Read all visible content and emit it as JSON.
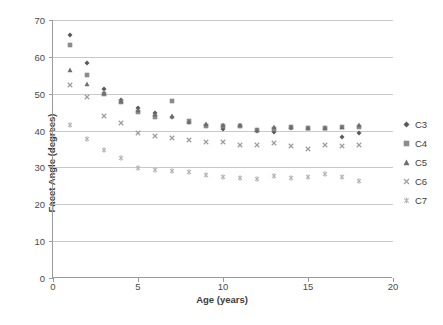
{
  "chart_data": {
    "type": "scatter",
    "title": "",
    "xlabel": "Age (years)",
    "ylabel": "Facet Angle (degrees)",
    "xlim": [
      0,
      20
    ],
    "ylim": [
      0,
      70
    ],
    "xticks": [
      0,
      5,
      10,
      15,
      20
    ],
    "yticks": [
      0,
      10,
      20,
      30,
      40,
      50,
      60,
      70
    ],
    "grid": "horizontal",
    "legend_position": "right",
    "x": [
      1,
      2,
      3,
      4,
      5,
      6,
      7,
      8,
      9,
      10,
      11,
      12,
      13,
      14,
      15,
      16,
      17,
      18
    ],
    "series": [
      {
        "name": "C3",
        "marker": "diamond",
        "color": "#595959",
        "values": [
          66.0,
          58.4,
          51.4,
          48.4,
          46.0,
          44.7,
          43.6,
          42.4,
          41.6,
          40.4,
          41.2,
          40.0,
          39.7,
          40.8,
          40.6,
          40.6,
          38.3,
          39.4
        ]
      },
      {
        "name": "C4",
        "marker": "square",
        "color": "#8c8c8c",
        "values": [
          63.2,
          55.2,
          49.8,
          47.7,
          45.0,
          43.8,
          47.9,
          42.5,
          41.2,
          41.3,
          41.3,
          40.1,
          40.4,
          40.9,
          40.8,
          40.7,
          40.9,
          41.0
        ]
      },
      {
        "name": "C5",
        "marker": "triangle",
        "color": "#6e6e6e",
        "values": [
          56.4,
          52.6,
          50.2,
          48.0,
          45.7,
          44.6,
          43.9,
          42.4,
          41.8,
          41.5,
          41.4,
          40.1,
          41.1,
          41.0,
          40.7,
          40.6,
          40.9,
          41.5
        ]
      },
      {
        "name": "C6",
        "marker": "cross",
        "color": "#9e9e9e",
        "values": [
          52.5,
          49.0,
          44.0,
          42.0,
          39.3,
          38.6,
          38.0,
          37.5,
          37.0,
          37.0,
          36.0,
          36.1,
          36.7,
          35.9,
          35.1,
          36.2,
          35.8,
          36.0
        ]
      },
      {
        "name": "C7",
        "marker": "asterisk",
        "color": "#b5b5b5",
        "values": [
          41.6,
          37.8,
          34.6,
          32.6,
          29.8,
          29.4,
          29.1,
          28.8,
          27.9,
          27.3,
          27.1,
          26.8,
          27.6,
          27.2,
          27.4,
          28.3,
          27.5,
          26.4
        ]
      }
    ]
  },
  "legend": {
    "items": [
      {
        "label": "C3"
      },
      {
        "label": "C4"
      },
      {
        "label": "C5"
      },
      {
        "label": "C6"
      },
      {
        "label": "C7"
      }
    ]
  }
}
